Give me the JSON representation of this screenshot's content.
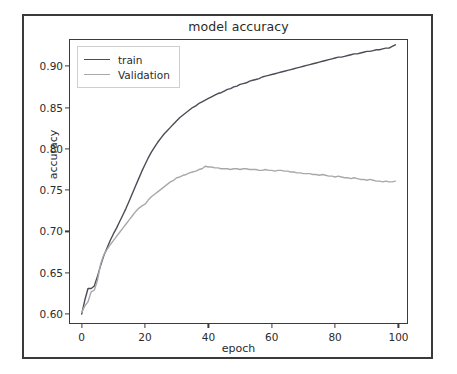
{
  "chart_data": {
    "type": "line",
    "title": "model accuracy",
    "xlabel": "epoch",
    "ylabel": "accuracy",
    "xlim": [
      -4,
      103
    ],
    "ylim": [
      0.588,
      0.933
    ],
    "grid": false,
    "legend_position": "upper left",
    "xticks": [
      0,
      20,
      40,
      60,
      80,
      100
    ],
    "xtick_labels": [
      "0",
      "20",
      "40",
      "60",
      "80",
      "100"
    ],
    "yticks": [
      0.6,
      0.65,
      0.7,
      0.75,
      0.8,
      0.85,
      0.9
    ],
    "ytick_labels": [
      "0.60",
      "0.65",
      "0.70",
      "0.75",
      "0.80",
      "0.85",
      "0.90"
    ],
    "x": [
      0,
      1,
      2,
      3,
      4,
      5,
      6,
      7,
      8,
      9,
      10,
      11,
      12,
      13,
      14,
      15,
      16,
      17,
      18,
      19,
      20,
      21,
      22,
      23,
      24,
      25,
      26,
      27,
      28,
      29,
      30,
      31,
      32,
      33,
      34,
      35,
      36,
      37,
      38,
      39,
      40,
      41,
      42,
      43,
      44,
      45,
      46,
      47,
      48,
      49,
      50,
      51,
      52,
      53,
      54,
      55,
      56,
      57,
      58,
      59,
      60,
      61,
      62,
      63,
      64,
      65,
      66,
      67,
      68,
      69,
      70,
      71,
      72,
      73,
      74,
      75,
      76,
      77,
      78,
      79,
      80,
      81,
      82,
      83,
      84,
      85,
      86,
      87,
      88,
      89,
      90,
      91,
      92,
      93,
      94,
      95,
      96,
      97,
      98,
      99
    ],
    "series": [
      {
        "name": "train",
        "color": "#4c4c57",
        "values": [
          0.6,
          0.617,
          0.631,
          0.631,
          0.634,
          0.646,
          0.659,
          0.671,
          0.68,
          0.689,
          0.697,
          0.704,
          0.712,
          0.72,
          0.728,
          0.737,
          0.746,
          0.755,
          0.764,
          0.773,
          0.781,
          0.789,
          0.796,
          0.802,
          0.808,
          0.813,
          0.818,
          0.822,
          0.826,
          0.83,
          0.834,
          0.838,
          0.841,
          0.844,
          0.847,
          0.85,
          0.852,
          0.855,
          0.857,
          0.859,
          0.861,
          0.863,
          0.865,
          0.867,
          0.868,
          0.87,
          0.872,
          0.873,
          0.875,
          0.876,
          0.878,
          0.879,
          0.88,
          0.882,
          0.883,
          0.884,
          0.885,
          0.887,
          0.888,
          0.889,
          0.89,
          0.891,
          0.892,
          0.893,
          0.894,
          0.895,
          0.896,
          0.897,
          0.898,
          0.899,
          0.9,
          0.901,
          0.902,
          0.903,
          0.904,
          0.905,
          0.906,
          0.907,
          0.908,
          0.909,
          0.91,
          0.911,
          0.911,
          0.912,
          0.913,
          0.914,
          0.915,
          0.915,
          0.916,
          0.917,
          0.918,
          0.918,
          0.919,
          0.92,
          0.92,
          0.921,
          0.922,
          0.922,
          0.924,
          0.926
        ]
      },
      {
        "name": "Validation",
        "color": "#a9a9ad",
        "values": [
          0.602,
          0.61,
          0.615,
          0.627,
          0.629,
          0.641,
          0.661,
          0.672,
          0.678,
          0.684,
          0.689,
          0.694,
          0.699,
          0.704,
          0.709,
          0.714,
          0.719,
          0.724,
          0.728,
          0.731,
          0.733,
          0.738,
          0.742,
          0.745,
          0.748,
          0.751,
          0.754,
          0.757,
          0.76,
          0.762,
          0.765,
          0.766,
          0.768,
          0.769,
          0.771,
          0.772,
          0.773,
          0.775,
          0.776,
          0.779,
          0.778,
          0.778,
          0.777,
          0.777,
          0.776,
          0.776,
          0.776,
          0.775,
          0.776,
          0.776,
          0.775,
          0.776,
          0.776,
          0.775,
          0.775,
          0.775,
          0.774,
          0.774,
          0.775,
          0.774,
          0.774,
          0.773,
          0.774,
          0.774,
          0.773,
          0.773,
          0.772,
          0.772,
          0.771,
          0.771,
          0.77,
          0.77,
          0.77,
          0.769,
          0.769,
          0.768,
          0.769,
          0.768,
          0.767,
          0.767,
          0.766,
          0.767,
          0.766,
          0.765,
          0.765,
          0.764,
          0.765,
          0.764,
          0.763,
          0.763,
          0.762,
          0.763,
          0.762,
          0.761,
          0.761,
          0.76,
          0.761,
          0.76,
          0.76,
          0.761
        ]
      }
    ],
    "legend": [
      {
        "label": "train",
        "color": "#4c4c57"
      },
      {
        "label": "Validation",
        "color": "#a9a9ad"
      }
    ]
  }
}
